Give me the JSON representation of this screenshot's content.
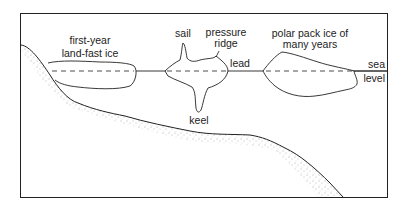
{
  "diagram": {
    "labels": {
      "first_year_line1": "first-year",
      "first_year_line2": "land-fast ice",
      "sail": "sail",
      "pressure_line1": "pressure",
      "pressure_line2": "ridge",
      "lead": "lead",
      "polar_line1": "polar pack ice of",
      "polar_line2": "many years",
      "sea": "sea",
      "level": "level",
      "keel": "keel"
    },
    "colors": {
      "line": "#222222",
      "background": "#ffffff",
      "stipple": "#555555"
    }
  }
}
